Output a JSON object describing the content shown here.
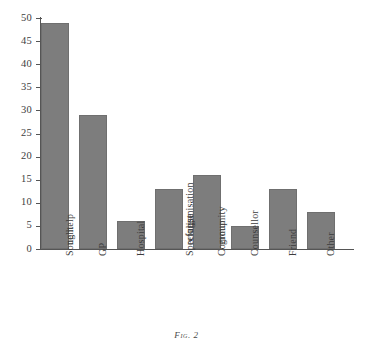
{
  "chart_data": {
    "type": "bar",
    "title": "",
    "subtitle": "",
    "caption": "Fig. 2",
    "xlabel": "",
    "ylabel": "",
    "ylim": [
      0,
      50
    ],
    "ytick_step": 5,
    "yticks": [
      0,
      5,
      10,
      15,
      20,
      25,
      30,
      35,
      40,
      45,
      50
    ],
    "grid": false,
    "legend": false,
    "legend_position": "none",
    "bar_color": "#7d7d7d",
    "bar_edge_color": "#6f6f6f",
    "axis_color": "#555555",
    "background": "#ffffff",
    "categories": [
      "Sought no help",
      "GP",
      "Hospital",
      "Specialist refugee organisation",
      "Community group",
      "Counsellor",
      "Friend",
      "Other"
    ],
    "category_lines": [
      [
        "Sought",
        "no help"
      ],
      [
        "GP"
      ],
      [
        "Hospital"
      ],
      [
        "Specialist",
        "refugee",
        "organisation"
      ],
      [
        "Community",
        "group"
      ],
      [
        "Counsellor"
      ],
      [
        "Friend"
      ],
      [
        "Other"
      ]
    ],
    "values": [
      49,
      29,
      6,
      13,
      16,
      5,
      13,
      8
    ]
  }
}
